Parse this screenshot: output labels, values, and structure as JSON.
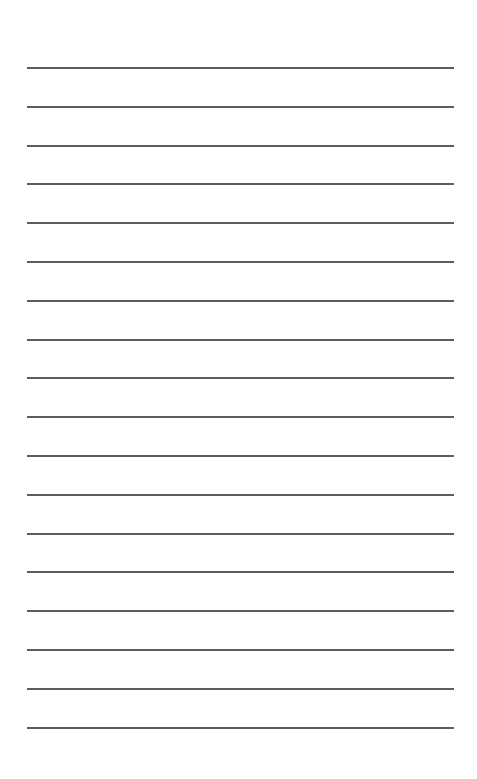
{
  "page": {
    "type": "lined-paper",
    "background": "#ffffff",
    "line_color": "#5c5c5c",
    "line_count": 18,
    "first_line_y": 67,
    "line_spacing": 38.8,
    "line_left": 27,
    "line_width": 427
  }
}
